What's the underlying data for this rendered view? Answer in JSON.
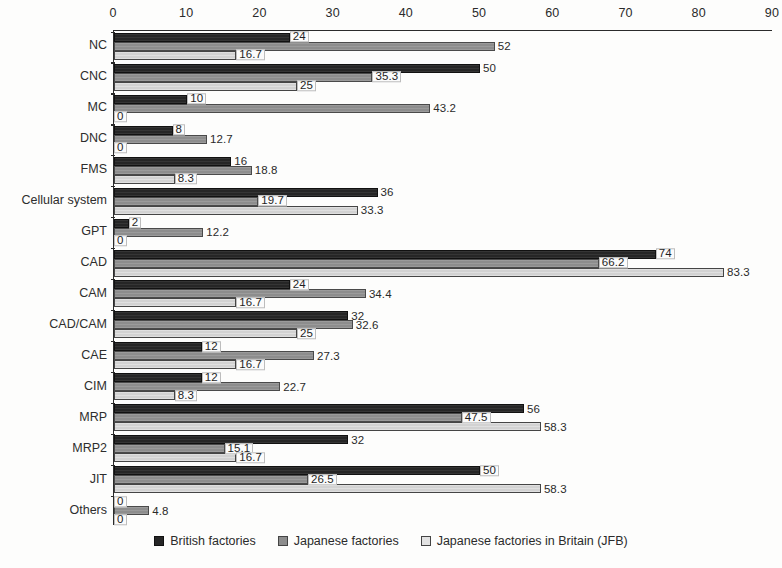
{
  "chart_data": {
    "type": "bar",
    "orientation": "horizontal",
    "title": "",
    "subtitle": "",
    "xlabel": "",
    "ylabel": "",
    "xlim": [
      0,
      90
    ],
    "xticks": [
      0,
      10,
      20,
      30,
      40,
      50,
      60,
      70,
      80,
      90
    ],
    "axis_position": "top",
    "grid": false,
    "legend_position": "bottom",
    "categories": [
      "NC",
      "CNC",
      "MC",
      "DNC",
      "FMS",
      "Cellular system",
      "GPT",
      "CAD",
      "CAM",
      "CAD/CAM",
      "CAE",
      "CIM",
      "MRP",
      "MRP2",
      "JIT",
      "Others"
    ],
    "series": [
      {
        "name": "British factories",
        "color": "#262626",
        "values": [
          24,
          50,
          10,
          8,
          16,
          36,
          2,
          74,
          24,
          32,
          12,
          12,
          56,
          32,
          50,
          0
        ],
        "labels": [
          "24",
          "50",
          "10",
          "8",
          "16",
          "36",
          "2",
          "74",
          "24",
          "32",
          "12",
          "12",
          "56",
          "32",
          "50",
          "0"
        ]
      },
      {
        "name": "Japanese factories",
        "color": "#8d8d8d",
        "values": [
          52,
          35.3,
          43.2,
          12.7,
          18.8,
          19.7,
          12.2,
          66.2,
          34.4,
          32.6,
          27.3,
          22.7,
          47.5,
          15.1,
          26.5,
          4.8
        ],
        "labels": [
          "52",
          "35.3",
          "43.2",
          "12.7",
          "18.8",
          "19.7",
          "12.2",
          "66.2",
          "34.4",
          "32.6",
          "27.3",
          "22.7",
          "47.5",
          "15.1",
          "26.5",
          "4.8"
        ]
      },
      {
        "name": "Japanese factories in Britain (JFB)",
        "color": "#d2d2d2",
        "values": [
          16.7,
          25,
          0,
          0,
          8.3,
          33.3,
          0,
          83.3,
          16.7,
          25,
          16.7,
          8.3,
          58.3,
          16.7,
          58.3,
          0
        ],
        "labels": [
          "16.7",
          "25",
          "0",
          "0",
          "8.3",
          "33.3",
          "0",
          "83.3",
          "16.7",
          "25",
          "16.7",
          "8.3",
          "58.3",
          "16.7",
          "58.3",
          "0"
        ]
      }
    ]
  },
  "legend": {
    "items": [
      {
        "label": "British factories"
      },
      {
        "label": "Japanese factories"
      },
      {
        "label": "Japanese factories in Britain (JFB)"
      }
    ]
  }
}
